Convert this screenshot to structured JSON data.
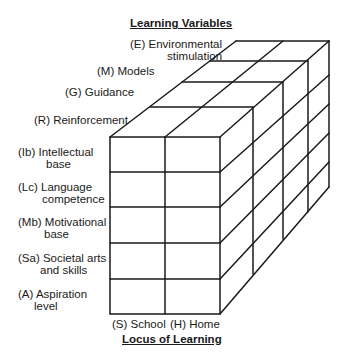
{
  "diagram": {
    "top_title": "Learning Variables",
    "bottom_title": "Locus of Learning",
    "depth_labels": [
      {
        "line1": "(E) Environmental",
        "line2": "stimulation"
      },
      {
        "line1": "(M) Models",
        "line2": ""
      },
      {
        "line1": "(G) Guidance",
        "line2": ""
      },
      {
        "line1": "(R) Reinforcement",
        "line2": ""
      }
    ],
    "row_labels": [
      {
        "line1": "(Ib) Intellectual",
        "line2": "base"
      },
      {
        "line1": "(Lc) Language",
        "line2": "competence"
      },
      {
        "line1": "(Mb) Motivational",
        "line2": "base"
      },
      {
        "line1": "(Sa) Societal arts",
        "line2": "and skills"
      },
      {
        "line1": "(A) Aspiration",
        "line2": "level"
      }
    ],
    "column_labels": [
      "(S) School",
      "(H) Home"
    ],
    "line_color": "#1a1a1a"
  }
}
